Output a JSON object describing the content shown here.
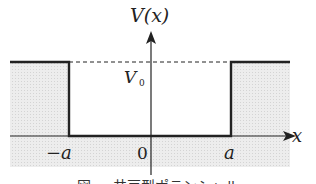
{
  "diagram": {
    "type": "finite square well potential",
    "y_axis_label": "V(x)",
    "x_axis_label": "x",
    "level_label": "V",
    "level_label_subscript": "0",
    "tick_labels": {
      "left": "−a",
      "origin": "0",
      "right": "a"
    },
    "caption": "図 ... 井戸型ポテンシャル",
    "colors": {
      "line": "#222222",
      "shade": "#e6e6e6",
      "background": "#ffffff"
    }
  }
}
